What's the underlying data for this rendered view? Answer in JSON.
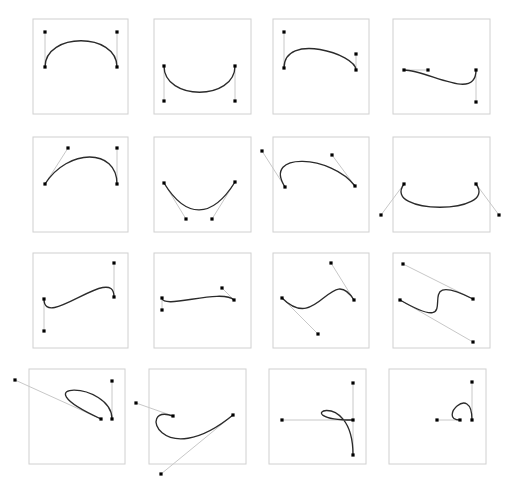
{
  "figure": {
    "rows": 4,
    "columns": 4,
    "background_color": "#ffffff",
    "frame_color": "#d0d0d0",
    "curve_color": "#2b2b2b",
    "handle_color": "#c8c8c8",
    "anchor_color": "#000000",
    "anchor_size": 3.2,
    "curve_width": 1.35,
    "handle_width": 1
  },
  "chart_data": {
    "type": "diagram",
    "cell_width": 131,
    "cell_height": 124,
    "grid": {
      "rows": 4,
      "cols": 4
    },
    "cells": [
      {
        "id": "r1c1",
        "row": 1,
        "col": 1,
        "name": "wide-arch-vertical-handles",
        "frame": {
          "x": 33,
          "y": 19,
          "w": 95,
          "h": 95
        },
        "p0": [
          45,
          67
        ],
        "c1": [
          45,
          32
        ],
        "c2": [
          117,
          32
        ],
        "p3": [
          117,
          67
        ]
      },
      {
        "id": "r1c2",
        "row": 1,
        "col": 2,
        "name": "wide-valley-vertical-handles",
        "frame": {
          "x": 154,
          "y": 19,
          "w": 97,
          "h": 95
        },
        "p0": [
          164,
          66
        ],
        "c1": [
          164,
          101
        ],
        "c2": [
          235,
          101
        ],
        "p3": [
          235,
          66
        ]
      },
      {
        "id": "r1c3",
        "row": 1,
        "col": 3,
        "name": "tilted-arch-short-right-handle",
        "frame": {
          "x": 273,
          "y": 19,
          "w": 96,
          "h": 95
        },
        "p0": [
          284,
          68
        ],
        "c1": [
          284,
          32
        ],
        "c2": [
          356,
          54
        ],
        "p3": [
          356,
          70
        ]
      },
      {
        "id": "r1c4",
        "row": 1,
        "col": 4,
        "name": "s-curve-horizontal-left-handle",
        "frame": {
          "x": 393,
          "y": 19,
          "w": 97,
          "h": 95
        },
        "p0": [
          404,
          70
        ],
        "c1": [
          428,
          70
        ],
        "c2": [
          476,
          102
        ],
        "p3": [
          476,
          70
        ]
      },
      {
        "id": "r2c1",
        "row": 2,
        "col": 1,
        "name": "arch-diagonal-left-handle",
        "frame": {
          "x": 33,
          "y": 137,
          "w": 95,
          "h": 95
        },
        "p0": [
          45,
          184
        ],
        "c1": [
          68,
          148
        ],
        "c2": [
          117,
          148
        ],
        "p3": [
          117,
          184
        ]
      },
      {
        "id": "r2c2",
        "row": 2,
        "col": 2,
        "name": "valley-inward-diagonal-handles",
        "frame": {
          "x": 154,
          "y": 137,
          "w": 97,
          "h": 95
        },
        "p0": [
          164,
          183
        ],
        "c1": [
          186,
          219
        ],
        "c2": [
          212,
          219
        ],
        "p3": [
          235,
          182
        ]
      },
      {
        "id": "r2c3",
        "row": 2,
        "col": 3,
        "name": "arch-handles-outside-frame",
        "frame": {
          "x": 273,
          "y": 137,
          "w": 96,
          "h": 95
        },
        "p0": [
          285,
          187
        ],
        "c1": [
          262,
          151
        ],
        "c2": [
          332,
          155
        ],
        "p3": [
          355,
          186
        ]
      },
      {
        "id": "r2c4",
        "row": 2,
        "col": 4,
        "name": "deep-valley-handles-outside-frame",
        "frame": {
          "x": 393,
          "y": 137,
          "w": 97,
          "h": 95
        },
        "p0": [
          404,
          184
        ],
        "c1": [
          381,
          215
        ],
        "c2": [
          499,
          215
        ],
        "p3": [
          476,
          184
        ]
      },
      {
        "id": "r3c1",
        "row": 3,
        "col": 1,
        "name": "s-curve-vertical-handles",
        "frame": {
          "x": 33,
          "y": 253,
          "w": 95,
          "h": 95
        },
        "p0": [
          44,
          299
        ],
        "c1": [
          44,
          331
        ],
        "c2": [
          114,
          263
        ],
        "p3": [
          114,
          297
        ]
      },
      {
        "id": "r3c2",
        "row": 3,
        "col": 2,
        "name": "shallow-wave-short-handles",
        "frame": {
          "x": 154,
          "y": 253,
          "w": 97,
          "h": 95
        },
        "p0": [
          162,
          298
        ],
        "c1": [
          162,
          310
        ],
        "c2": [
          222,
          288
        ],
        "p3": [
          234,
          300
        ]
      },
      {
        "id": "r3c3",
        "row": 3,
        "col": 3,
        "name": "s-curve-long-diagonal-handles",
        "frame": {
          "x": 273,
          "y": 253,
          "w": 96,
          "h": 95
        },
        "p0": [
          282,
          298
        ],
        "c1": [
          318,
          334
        ],
        "c2": [
          331,
          263
        ],
        "p3": [
          354,
          300
        ]
      },
      {
        "id": "r3c4",
        "row": 3,
        "col": 4,
        "name": "steep-s-curve-parallel-handles",
        "frame": {
          "x": 393,
          "y": 253,
          "w": 97,
          "h": 95
        },
        "p0": [
          400,
          300
        ],
        "c1": [
          473,
          342
        ],
        "c2": [
          403,
          264
        ],
        "p3": [
          473,
          299
        ]
      },
      {
        "id": "r4c1",
        "row": 4,
        "col": 1,
        "name": "loop-curve-long-left-handle",
        "frame": {
          "x": 29,
          "y": 369,
          "w": 96,
          "h": 95
        },
        "p0": [
          101,
          419
        ],
        "c1": [
          15,
          380
        ],
        "c2": [
          112,
          381
        ],
        "p3": [
          112,
          419
        ]
      },
      {
        "id": "r4c2",
        "row": 4,
        "col": 2,
        "name": "hook-curve-crossing-handles",
        "frame": {
          "x": 149,
          "y": 369,
          "w": 97,
          "h": 95
        },
        "p0": [
          173,
          416
        ],
        "c1": [
          136,
          403
        ],
        "c2": [
          161,
          474
        ],
        "p3": [
          233,
          415
        ]
      },
      {
        "id": "r4c3",
        "row": 4,
        "col": 3,
        "name": "tight-hook-curve",
        "frame": {
          "x": 269,
          "y": 369,
          "w": 97,
          "h": 95
        },
        "p0": [
          353,
          420
        ],
        "c1": [
          282,
          420
        ],
        "c2": [
          353,
          383
        ],
        "p3": [
          353,
          455
        ]
      },
      {
        "id": "r4c4",
        "row": 4,
        "col": 4,
        "name": "small-arch-curve",
        "frame": {
          "x": 389,
          "y": 369,
          "w": 97,
          "h": 95
        },
        "p0": [
          460,
          420
        ],
        "c1": [
          437,
          420
        ],
        "c2": [
          472,
          382
        ],
        "p3": [
          472,
          420
        ]
      }
    ]
  }
}
